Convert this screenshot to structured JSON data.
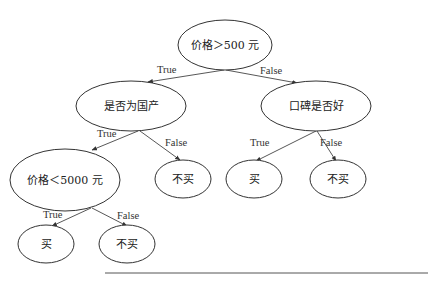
{
  "diagram": {
    "type": "decision-tree",
    "nodes": {
      "root": {
        "label": "价格＞500 元"
      },
      "domestic": {
        "label": "是否为国产"
      },
      "reputation": {
        "label": "口碑是否好"
      },
      "price_lt": {
        "label": "价格＜5000 元"
      },
      "domestic_false_leaf": {
        "label": "不买"
      },
      "reputation_true_leaf": {
        "label": "买"
      },
      "reputation_false_leaf": {
        "label": "不买"
      },
      "price_true_leaf": {
        "label": "买"
      },
      "price_false_leaf": {
        "label": "不买"
      }
    },
    "edges": {
      "root_true": "True",
      "root_false": "False",
      "domestic_true": "True",
      "domestic_false": "False",
      "reputation_true": "True",
      "reputation_false": "False",
      "price_true": "True",
      "price_false": "False"
    }
  }
}
